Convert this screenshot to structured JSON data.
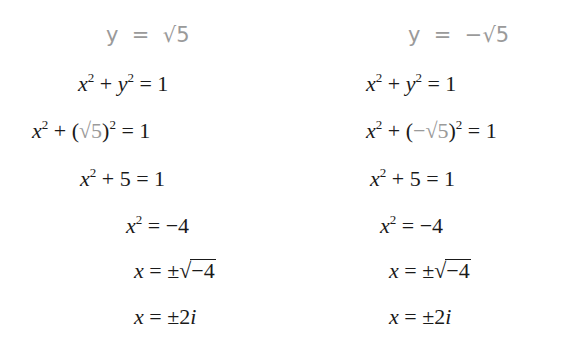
{
  "left_column": {
    "header": {
      "lhs": "y",
      "eq": "=",
      "rhs_radicand": "5",
      "rhs_sign": ""
    },
    "lines": [
      "x² + y² = 1",
      "x² + (√5)² = 1",
      "x² + 5 = 1",
      "x² = −4",
      "x = ±√−4",
      "x = ±2i"
    ]
  },
  "right_column": {
    "header": {
      "lhs": "y",
      "eq": "=",
      "rhs_radicand": "5",
      "rhs_sign": "−"
    },
    "lines": [
      "x² + y² = 1",
      "x² + (−√5)² = 1",
      "x² + 5 = 1",
      "x² = −4",
      "x = ±√−4",
      "x = ±2i"
    ]
  },
  "colors": {
    "highlight_gray": "#9a9a9a",
    "text": "#1a1a1a"
  }
}
